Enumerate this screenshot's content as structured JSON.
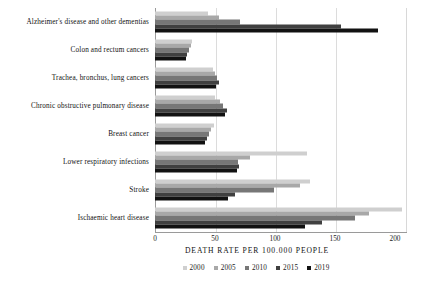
{
  "chart_data": {
    "type": "bar",
    "orientation": "horizontal",
    "title": "",
    "xlabel": "DEATH RATE PER 100.000 PEOPLE",
    "ylabel": "",
    "xlim": [
      0,
      210
    ],
    "xticks": [
      0,
      50,
      100,
      150,
      200
    ],
    "xtick_labels": [
      "0",
      "50",
      "100",
      "150",
      "200"
    ],
    "grid": true,
    "legend_position": "bottom",
    "categories": [
      "Alzheimer's disease and other dementias",
      "Colon and rectum cancers",
      "Trachea, bronchus, lung cancers",
      "Chronic obstructive pulmonary disease",
      "Breast cancer",
      "Lower respiratory infections",
      "Stroke",
      "Ischaemic heart disease"
    ],
    "series": [
      {
        "name": "2000",
        "color": "#cfcfcf",
        "values": [
          44,
          31,
          48,
          50,
          49,
          127,
          129,
          206
        ]
      },
      {
        "name": "2005",
        "color": "#a8a8a8",
        "values": [
          53,
          30,
          50,
          54,
          47,
          79,
          121,
          178
        ]
      },
      {
        "name": "2010",
        "color": "#777777",
        "values": [
          71,
          28,
          52,
          57,
          45,
          69,
          99,
          167
        ]
      },
      {
        "name": "2015",
        "color": "#404040",
        "values": [
          155,
          27,
          53,
          60,
          43,
          70,
          67,
          139
        ]
      },
      {
        "name": "2019",
        "color": "#121212",
        "values": [
          186,
          26,
          51,
          58,
          42,
          68,
          61,
          125
        ]
      }
    ]
  },
  "legend": {
    "entries": [
      "2000",
      "2005",
      "2010",
      "2015",
      "2019"
    ]
  },
  "axis": {
    "x_title": "DEATH RATE PER 100.000 PEOPLE",
    "tick_labels": [
      "0",
      "50",
      "100",
      "150",
      "200"
    ]
  }
}
